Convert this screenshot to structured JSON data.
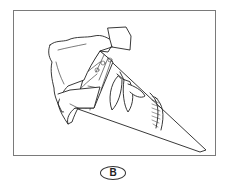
{
  "figure": {
    "label": "B",
    "colors": {
      "frame_border": "#7a7a7a",
      "line": "#222222",
      "background": "#ffffff"
    }
  }
}
